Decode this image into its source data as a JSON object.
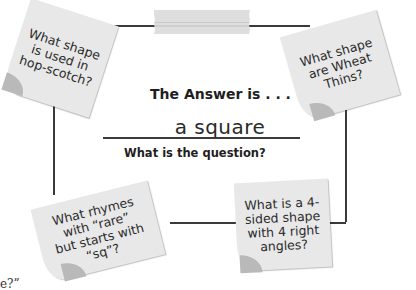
{
  "center": {
    "title": "The Answer is . . .",
    "answer": "a square",
    "prompt": "What is the question?"
  },
  "notes": [
    {
      "position": "top-left",
      "text": "What shape is used in hop-scotch?"
    },
    {
      "position": "top-right",
      "text": "What shape are Wheat Thins?"
    },
    {
      "position": "bottom-left",
      "text": "What rhymes with “rare” but starts with “sq”?"
    },
    {
      "position": "bottom-right",
      "text": "What is a 4-sided shape with 4 right angles?"
    }
  ],
  "footer": {
    "cropped_text": "e?”"
  },
  "colors": {
    "note_fill": "#e8e8e8",
    "note_curl": "#b9b9b9",
    "tape": "#dcdcdc",
    "frame_line": "#3a3a3a"
  }
}
